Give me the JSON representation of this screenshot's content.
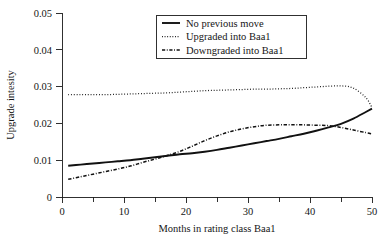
{
  "chart_data": {
    "type": "line",
    "title": "",
    "xlabel": "Months in rating class Baa1",
    "ylabel": "Upgrade intesity",
    "xlim": [
      0,
      50
    ],
    "ylim": [
      0,
      0.05
    ],
    "grid": false,
    "legend_position": "top-center",
    "xticks": [
      0,
      10,
      20,
      30,
      40,
      50
    ],
    "xtick_labels": [
      "0",
      "10",
      "20",
      "30",
      "40",
      "50"
    ],
    "xminor_ticks": [
      5,
      15,
      25,
      35,
      45
    ],
    "yticks": [
      0,
      0.01,
      0.02,
      0.03,
      0.04,
      0.05
    ],
    "ytick_labels": [
      "0",
      "0.01",
      "0.02",
      "0.03",
      "0.04",
      "0.05"
    ],
    "x": [
      1,
      3,
      5,
      7,
      9,
      11,
      13,
      15,
      17,
      19,
      21,
      23,
      25,
      27,
      29,
      31,
      33,
      35,
      37,
      39,
      41,
      43,
      45,
      47,
      49,
      50
    ],
    "series": [
      {
        "name": "No previous move",
        "style": "solid",
        "color": "#111111",
        "values": [
          0.0085,
          0.0088,
          0.0091,
          0.0094,
          0.0097,
          0.01,
          0.0104,
          0.0108,
          0.0112,
          0.0116,
          0.0119,
          0.0123,
          0.0128,
          0.0134,
          0.014,
          0.0146,
          0.0152,
          0.0158,
          0.0165,
          0.0172,
          0.018,
          0.0189,
          0.0199,
          0.0213,
          0.0231,
          0.024
        ]
      },
      {
        "name": "Upgraded into Baa1",
        "style": "dotted",
        "color": "#111111",
        "values": [
          0.0278,
          0.0278,
          0.0278,
          0.0278,
          0.0279,
          0.028,
          0.0281,
          0.0282,
          0.0283,
          0.0285,
          0.0287,
          0.0289,
          0.029,
          0.0291,
          0.0292,
          0.0293,
          0.0293,
          0.0294,
          0.0295,
          0.0297,
          0.0299,
          0.0301,
          0.0302,
          0.0296,
          0.027,
          0.0243
        ]
      },
      {
        "name": "Downgraded into Baa1",
        "style": "dashdot",
        "color": "#111111",
        "values": [
          0.0048,
          0.0055,
          0.0062,
          0.0069,
          0.0076,
          0.0084,
          0.0094,
          0.0103,
          0.0113,
          0.0124,
          0.0138,
          0.0153,
          0.0166,
          0.0177,
          0.0185,
          0.0191,
          0.0195,
          0.0196,
          0.0196,
          0.0196,
          0.0195,
          0.0194,
          0.0189,
          0.0182,
          0.0175,
          0.0171
        ]
      }
    ]
  },
  "legend": {
    "items": [
      {
        "label": "No previous move",
        "style": "solid"
      },
      {
        "label": "Upgraded into Baa1",
        "style": "dotted"
      },
      {
        "label": "Downgraded into Baa1",
        "style": "dashdot"
      }
    ]
  }
}
